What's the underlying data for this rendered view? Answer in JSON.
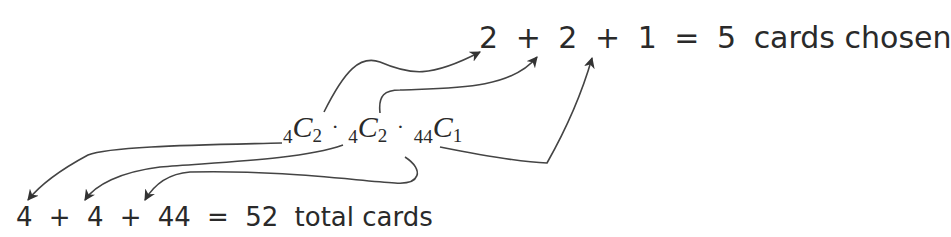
{
  "top_equation": {
    "terms": [
      "2",
      "2",
      "1"
    ],
    "plus": "+",
    "equals": "=",
    "result": "5",
    "label": "cards chosen"
  },
  "middle_expression": {
    "factors": [
      {
        "n": "4",
        "k": "2"
      },
      {
        "n": "4",
        "k": "2"
      },
      {
        "n": "44",
        "k": "1"
      }
    ],
    "symbol": "C",
    "operator": "·"
  },
  "bottom_equation": {
    "terms": [
      "4",
      "4",
      "44"
    ],
    "plus": "+",
    "equals": "=",
    "result": "52",
    "label": "total cards"
  },
  "colors": {
    "ink": "#2a2a2a",
    "background": "#ffffff"
  }
}
